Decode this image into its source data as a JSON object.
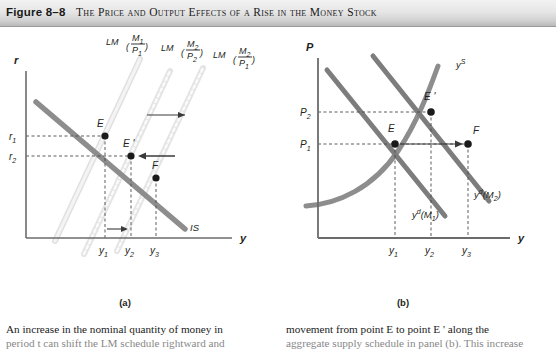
{
  "title": {
    "figure_number": "Figure 8–8",
    "caption": "The Price and Output Effects of a Rise in the Money Stock"
  },
  "panels": [
    {
      "id": "a",
      "caption": "(a)",
      "x_axis_label": "y",
      "y_axis_label": "r",
      "x_ticks": [
        "y",
        "y",
        "y"
      ],
      "x_tick_labels": [
        "y1",
        "y2",
        "y3"
      ],
      "x_tick_subs": [
        "1",
        "2",
        "3"
      ],
      "y_tick_labels": [
        "r1",
        "r2"
      ],
      "y_tick_subs": [
        "1",
        "2"
      ],
      "point_labels": [
        "E",
        "E '",
        "F"
      ],
      "curves": [
        {
          "name": "LM1",
          "label": "LM",
          "arg_num": "M",
          "arg_num_sub": "1",
          "arg_den": "P",
          "arg_den_sub": "1"
        },
        {
          "name": "LM2",
          "label": "LM",
          "arg_num": "M",
          "arg_num_sub": "2",
          "arg_den": "P",
          "arg_den_sub": "2"
        },
        {
          "name": "LM3",
          "label": "LM",
          "arg_num": "M",
          "arg_num_sub": "2",
          "arg_den": "P",
          "arg_den_sub": "1"
        },
        {
          "name": "IS",
          "label": "IS"
        }
      ]
    },
    {
      "id": "b",
      "caption": "(b)",
      "x_axis_label": "y",
      "y_axis_label": "P",
      "x_tick_labels": [
        "y1",
        "y2",
        "y3"
      ],
      "x_tick_subs": [
        "1",
        "2",
        "3"
      ],
      "y_tick_labels": [
        "P2",
        "P1"
      ],
      "y_tick_subs": [
        "2",
        "1"
      ],
      "point_labels": [
        "E",
        "E '",
        "F"
      ],
      "curves": [
        {
          "name": "supply",
          "label": "y",
          "sup": "S"
        },
        {
          "name": "demand-M1",
          "label": "y",
          "sup": "d",
          "arg": "(M",
          "arg_sub": "1",
          "arg_close": ")"
        },
        {
          "name": "demand-M2",
          "label": "y",
          "sup": "d",
          "arg": "(M",
          "arg_sub": "2",
          "arg_close": ")"
        }
      ]
    }
  ],
  "body_text": {
    "left": [
      "An increase in the nominal quantity of money in",
      "period t can shift the LM schedule rightward and"
    ],
    "right": [
      "movement from point E to point E ' along the",
      "aggregate supply schedule in panel (b). This increase"
    ]
  },
  "colors": {
    "is_curve": "#8d8d8d",
    "lm_curve": "#e3e3e3",
    "supply_curve": "#8d8d8d",
    "demand_curve": "#7d7d7d",
    "axis": "#6b6b6b",
    "point": "#1a1a1a",
    "dashed": "#4a4a4a",
    "title_bar_top": "#f2f2f2",
    "title_bar_bottom": "#b9b9b9"
  }
}
